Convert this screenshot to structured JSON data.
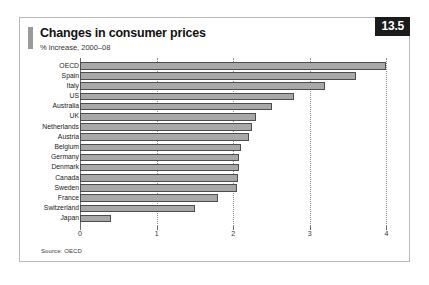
{
  "panel": {
    "figure_number": "13.5",
    "title": "Changes in consumer prices",
    "subtitle": "% increase, 2000–08",
    "source": "Source: OECD"
  },
  "chart_data": {
    "type": "bar",
    "orientation": "horizontal",
    "title": "Changes in consumer prices",
    "subtitle": "% increase, 2000–08",
    "xlabel": "",
    "ylabel": "",
    "xlim": [
      0,
      4.25
    ],
    "xticks": [
      0,
      1,
      2,
      3,
      4
    ],
    "xtick_labels": [
      "0",
      "1",
      "2",
      "3",
      "4"
    ],
    "grid": "vertical-dotted",
    "legend": "none",
    "bar_color": "#a8a8a8",
    "bar_edge_color": "#4d4d4d",
    "categories": [
      "OECD",
      "Spain",
      "Italy",
      "US",
      "Australia",
      "UK",
      "Netherlands",
      "Austria",
      "Belgium",
      "Germany",
      "Denmark",
      "Canada",
      "Sweden",
      "France",
      "Switzerland",
      "Japan"
    ],
    "values": [
      4.0,
      3.6,
      3.2,
      2.8,
      2.5,
      2.3,
      2.25,
      2.2,
      2.1,
      2.08,
      2.07,
      2.06,
      2.05,
      1.8,
      1.5,
      0.4
    ],
    "source": "Source: OECD"
  }
}
